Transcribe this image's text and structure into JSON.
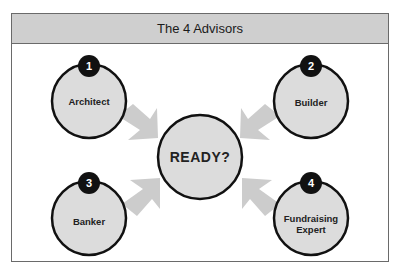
{
  "header": {
    "title": "The 4 Advisors"
  },
  "center": {
    "label": "READY?"
  },
  "advisors": [
    {
      "number": "1",
      "label": "Architect"
    },
    {
      "number": "2",
      "label": "Builder"
    },
    {
      "number": "3",
      "label": "Banker"
    },
    {
      "number": "4",
      "label": "Fundraising Expert"
    }
  ],
  "colors": {
    "circle_fill": "#dcdcdc",
    "circle_stroke": "#111111",
    "arrow_fill": "#cccccc",
    "header_bg": "#cfcfcf",
    "badge_bg": "#111111"
  }
}
